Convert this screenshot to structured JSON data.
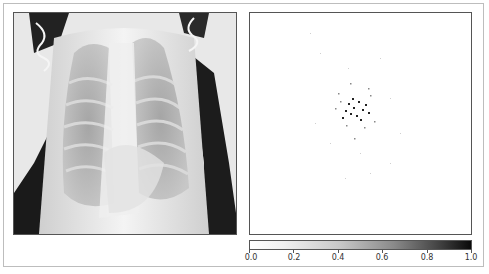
{
  "figure": {
    "left_panel": {
      "name": "chest-xray-image",
      "description": "Pediatric chest X-ray (grayscale)"
    },
    "right_panel": {
      "name": "attribution-heatmap",
      "description": "Sparse saliency/attribution map with dark speckles concentrated near center"
    },
    "colorbar": {
      "ticks": [
        "0.0",
        "0.2",
        "0.4",
        "0.6",
        "0.8",
        "1.0"
      ],
      "min": 0.0,
      "max": 1.0,
      "colormap": "Greys",
      "colors": {
        "low": "#ffffff",
        "high": "#0a0a0a"
      }
    }
  }
}
